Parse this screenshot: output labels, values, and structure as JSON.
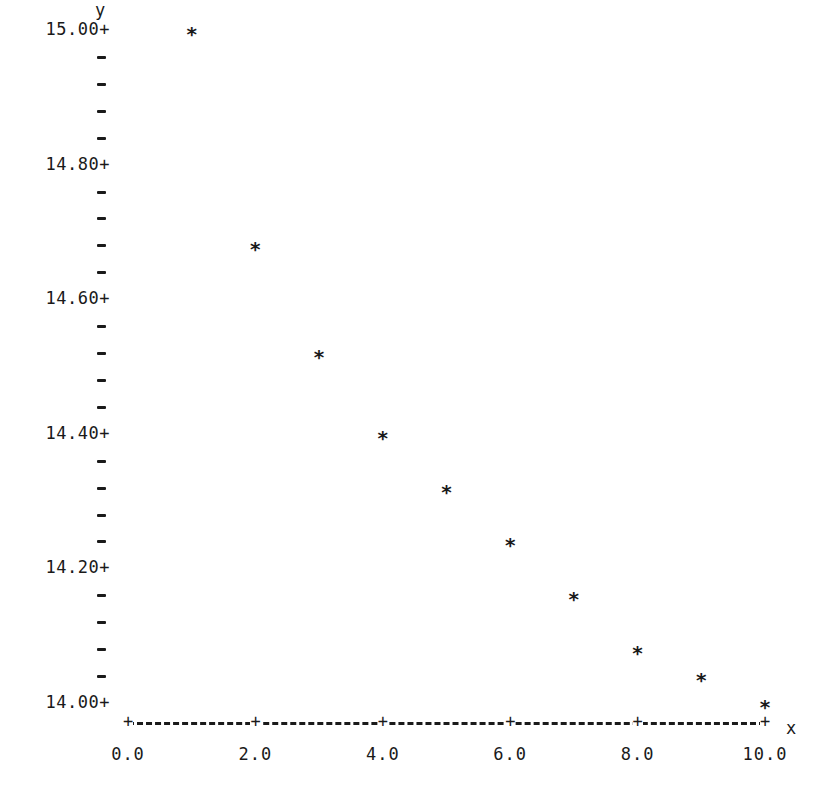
{
  "chart_data": {
    "type": "scatter",
    "title": "",
    "xlabel": "x",
    "ylabel": "y",
    "xlim": [
      0.0,
      10.0
    ],
    "ylim": [
      14.0,
      15.0
    ],
    "grid": false,
    "legend": null,
    "marker": "*",
    "x_ticks": [
      "0.0",
      "2.0",
      "4.0",
      "6.0",
      "8.0",
      "10.0"
    ],
    "y_ticks": [
      "14.00+",
      "14.20+",
      "14.40+",
      "14.60+",
      "14.80+",
      "15.00+"
    ],
    "y_minor_tick_step": 0.04,
    "x": [
      1,
      2,
      3,
      4,
      5,
      6,
      7,
      8,
      9,
      10
    ],
    "y": [
      15.0,
      14.68,
      14.52,
      14.4,
      14.32,
      14.24,
      14.16,
      14.08,
      14.04,
      14.0
    ]
  },
  "axes": {
    "x_name": "x",
    "y_name": "y",
    "x_axis_line": "+----------+----------+----------+----------+----------+"
  },
  "layout": {
    "x0_px": 128,
    "x1_px": 765,
    "y_top_px": 30,
    "y_bottom_px": 703
  }
}
